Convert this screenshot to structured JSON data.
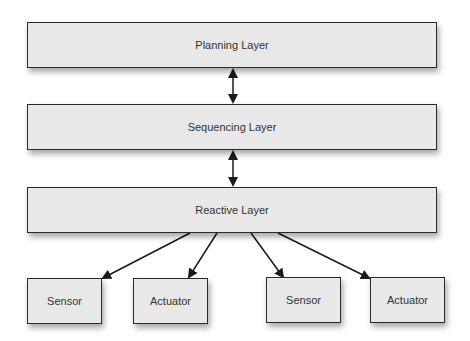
{
  "diagram": {
    "type": "layered-architecture",
    "layers": [
      {
        "id": "planning",
        "label": "Planning Layer"
      },
      {
        "id": "sequencing",
        "label": "Sequencing Layer"
      },
      {
        "id": "reactive",
        "label": "Reactive Layer"
      }
    ],
    "components": [
      {
        "id": "sensor-1",
        "label": "Sensor"
      },
      {
        "id": "actuator-1",
        "label": "Actuator"
      },
      {
        "id": "sensor-2",
        "label": "Sensor"
      },
      {
        "id": "actuator-2",
        "label": "Actuator"
      }
    ],
    "edges": [
      {
        "from": "planning",
        "to": "sequencing",
        "direction": "bidirectional"
      },
      {
        "from": "sequencing",
        "to": "reactive",
        "direction": "bidirectional"
      },
      {
        "from": "reactive",
        "to": "sensor-1",
        "direction": "forward"
      },
      {
        "from": "reactive",
        "to": "actuator-1",
        "direction": "forward"
      },
      {
        "from": "reactive",
        "to": "sensor-2",
        "direction": "forward"
      },
      {
        "from": "reactive",
        "to": "actuator-2",
        "direction": "forward"
      }
    ],
    "colors": {
      "box_fill": "#e8e8e8",
      "box_border": "#2a2a2a",
      "text": "#333333",
      "arrow": "#1a1a1a"
    }
  }
}
